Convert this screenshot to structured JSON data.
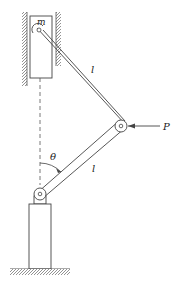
{
  "diagram": {
    "type": "mechanism",
    "labels": {
      "mass": "m",
      "upper_link": "l",
      "lower_link": "l",
      "force": "P",
      "angle": "θ"
    },
    "colors": {
      "line": "#444444",
      "hatch": "#888888",
      "background": "#ffffff"
    }
  }
}
